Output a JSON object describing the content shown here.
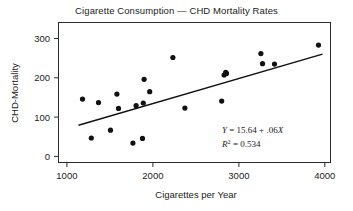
{
  "chart_data": {
    "type": "scatter",
    "title": "Cigarette Consumption — CHD Mortality Rates",
    "xlabel": "Cigarettes per Year",
    "ylabel": "CHD-Mortality",
    "xlim": [
      750,
      4150
    ],
    "ylim": [
      -20,
      340
    ],
    "xticks": [
      1000,
      2000,
      3000,
      4000
    ],
    "xtick_labels": [
      "1000",
      "2000",
      "3000",
      "4000"
    ],
    "yticks": [
      0,
      100,
      200,
      300
    ],
    "ytick_labels": [
      "0",
      "100",
      "200",
      "300"
    ],
    "grid": false,
    "legend": null,
    "x": [
      1050,
      1160,
      1250,
      1400,
      1480,
      1500,
      1680,
      1720,
      1800,
      1810,
      1820,
      1890,
      2180,
      2330,
      2790,
      2820,
      2840,
      2850,
      3280,
      3300,
      3450,
      4000
    ],
    "y": [
      143,
      43,
      134,
      63,
      156,
      119,
      30,
      126,
      42,
      133,
      194,
      162,
      250,
      120,
      138,
      205,
      212,
      209,
      260,
      234,
      233,
      282
    ],
    "points": [
      {
        "x": 1050,
        "y": 143
      },
      {
        "x": 1160,
        "y": 43
      },
      {
        "x": 1250,
        "y": 134
      },
      {
        "x": 1400,
        "y": 63
      },
      {
        "x": 1480,
        "y": 156
      },
      {
        "x": 1500,
        "y": 119
      },
      {
        "x": 1680,
        "y": 30
      },
      {
        "x": 1720,
        "y": 126
      },
      {
        "x": 1800,
        "y": 42
      },
      {
        "x": 1810,
        "y": 133
      },
      {
        "x": 1820,
        "y": 194
      },
      {
        "x": 1890,
        "y": 162
      },
      {
        "x": 2180,
        "y": 250
      },
      {
        "x": 2330,
        "y": 120
      },
      {
        "x": 2790,
        "y": 138
      },
      {
        "x": 2820,
        "y": 205
      },
      {
        "x": 2840,
        "y": 212
      },
      {
        "x": 2850,
        "y": 209
      },
      {
        "x": 3280,
        "y": 260
      },
      {
        "x": 3300,
        "y": 234
      },
      {
        "x": 3450,
        "y": 233
      },
      {
        "x": 4000,
        "y": 282
      }
    ],
    "regression": {
      "intercept": 15.64,
      "slope": 0.06,
      "r_squared": 0.534,
      "x_start": 1000,
      "x_end": 4050,
      "y_start": 75.64,
      "y_end": 258.64
    },
    "annotations": [
      {
        "name": "regression-equation",
        "text": "Y = 15.64 + .06X"
      },
      {
        "name": "r-squared",
        "text": "R2 = 0.534"
      }
    ],
    "colors": {
      "point": "#111111",
      "line": "#111111",
      "frame": "#2b2b2b",
      "text": "#222222",
      "background": "#ffffff"
    }
  },
  "annotation": {
    "equation_y": "Y",
    "equation_rest": " = 15.64 + .06",
    "equation_x": "X",
    "r_symbol": "R",
    "r_exponent": "2",
    "r_value": " = 0.534"
  }
}
